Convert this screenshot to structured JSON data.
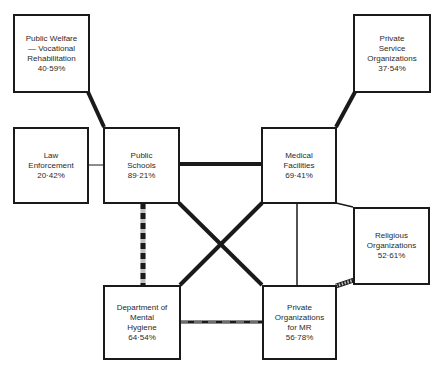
{
  "diagram": {
    "nodes": [
      {
        "id": "public-welfare",
        "lines": [
          "Public Welfare",
          "— Vocational",
          "Rehabilitation",
          "40·59%"
        ],
        "label": "Public Welfare — Vocational Rehabilitation",
        "value": "40·59%"
      },
      {
        "id": "private-service",
        "lines": [
          "Private",
          "Service",
          "Organizations",
          "37·54%"
        ],
        "label": "Private Service Organizations",
        "value": "37·54%"
      },
      {
        "id": "law-enforcement",
        "lines": [
          "Law",
          "Enforcement",
          "20·42%"
        ],
        "label": "Law Enforcement",
        "value": "20·42%"
      },
      {
        "id": "public-schools",
        "lines": [
          "Public",
          "Schools",
          "89·21%"
        ],
        "label": "Public Schools",
        "value": "89·21%"
      },
      {
        "id": "medical-facilities",
        "lines": [
          "Medical",
          "Facilities",
          "69·41%"
        ],
        "label": "Medical Facilities",
        "value": "69·41%"
      },
      {
        "id": "religious-organizations",
        "lines": [
          "Religious",
          "Organizations",
          "52·61%"
        ],
        "label": "Religious Organizations",
        "value": "52·61%"
      },
      {
        "id": "dept-mental-hygiene",
        "lines": [
          "Department of",
          "Mental",
          "Hygiene",
          "64·54%"
        ],
        "label": "Department of Mental Hygiene",
        "value": "64·54%"
      },
      {
        "id": "private-orgs-mr",
        "lines": [
          "Private",
          "Organizations",
          "for MR",
          "56·78%"
        ],
        "label": "Private Organizations for MR",
        "value": "56·78%"
      }
    ],
    "edges": [
      {
        "from": "public-welfare",
        "to": "public-schools",
        "style": "heavy"
      },
      {
        "from": "private-service",
        "to": "medical-facilities",
        "style": "heavy"
      },
      {
        "from": "law-enforcement",
        "to": "public-schools",
        "style": "thin"
      },
      {
        "from": "public-schools",
        "to": "medical-facilities",
        "style": "heavy"
      },
      {
        "from": "public-schools",
        "to": "private-orgs-mr",
        "style": "heavy"
      },
      {
        "from": "medical-facilities",
        "to": "dept-mental-hygiene",
        "style": "heavy"
      },
      {
        "from": "public-schools",
        "to": "dept-mental-hygiene",
        "style": "dashed-heavy"
      },
      {
        "from": "dept-mental-hygiene",
        "to": "private-orgs-mr",
        "style": "dashed-light"
      },
      {
        "from": "medical-facilities",
        "to": "private-orgs-mr",
        "style": "thin"
      },
      {
        "from": "medical-facilities",
        "to": "religious-organizations",
        "style": "thin"
      },
      {
        "from": "private-orgs-mr",
        "to": "religious-organizations",
        "style": "dashed-heavy"
      }
    ],
    "colors": {
      "line": "#1a1a1a",
      "background": "#ffffff",
      "dash_light": "#bfbfbf"
    }
  }
}
